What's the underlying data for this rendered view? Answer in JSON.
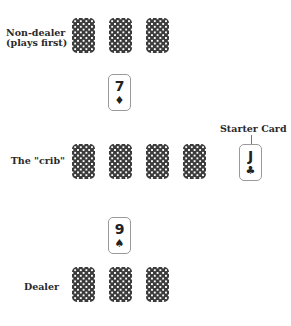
{
  "labels": {
    "non_dealer_line1": "Non-dealer",
    "non_dealer_line2": "(plays first)",
    "crib": "The \"crib\"",
    "starter": "Starter Card",
    "dealer": "Dealer"
  },
  "played_cards": {
    "non_dealer": {
      "rank": "7",
      "suit": "♦",
      "suit_name": "diamonds"
    },
    "dealer": {
      "rank": "9",
      "suit": "♠",
      "suit_name": "spades"
    }
  },
  "starter_card": {
    "rank": "J",
    "suit": "♣",
    "suit_name": "clubs"
  },
  "hands": {
    "non_dealer_face_down_count": 3,
    "crib_face_down_count": 4,
    "dealer_face_down_count": 3
  },
  "colors": {
    "card_back": "#3b3b3b",
    "card_border": "#9a9a9a",
    "text": "#222222"
  }
}
